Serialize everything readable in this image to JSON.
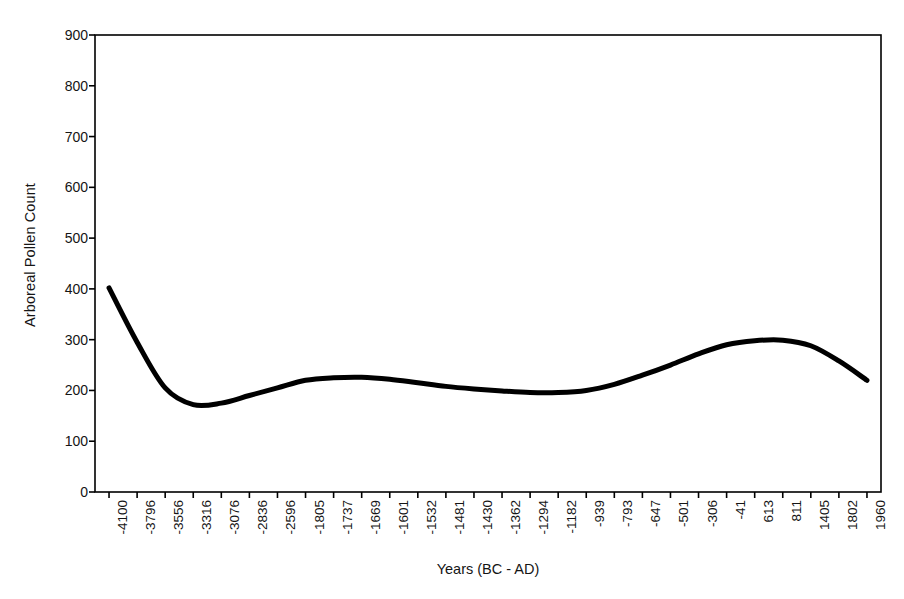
{
  "chart_data": {
    "type": "line",
    "title": "",
    "xlabel": "Years (BC - AD)",
    "ylabel": "Arboreal Pollen Count",
    "ylim": [
      0,
      900
    ],
    "yticks": [
      0,
      100,
      200,
      300,
      400,
      500,
      600,
      700,
      800,
      900
    ],
    "grid": false,
    "legend": "none",
    "categories": [
      "-4100",
      "-3796",
      "-3556",
      "-3316",
      "-3076",
      "-2836",
      "-2596",
      "-1805",
      "-1737",
      "-1669",
      "-1601",
      "-1532",
      "-1481",
      "-1430",
      "-1362",
      "-1294",
      "-1182",
      "-939",
      "-793",
      "-647",
      "-501",
      "-306",
      "-41",
      "613",
      "811",
      "1405",
      "1802",
      "1960"
    ],
    "values": [
      402,
      295,
      205,
      172,
      175,
      190,
      205,
      220,
      225,
      226,
      222,
      215,
      208,
      203,
      199,
      196,
      196,
      200,
      212,
      230,
      250,
      272,
      290,
      298,
      299,
      288,
      258,
      220
    ],
    "series": [
      {
        "name": "Arboreal Pollen Count",
        "color": "#000000",
        "line_width": 5,
        "values": [
          402,
          295,
          205,
          172,
          175,
          190,
          205,
          220,
          225,
          226,
          222,
          215,
          208,
          203,
          199,
          196,
          196,
          200,
          212,
          230,
          250,
          272,
          290,
          298,
          299,
          288,
          258,
          220
        ]
      }
    ],
    "axis_color": "#000000",
    "background": "#ffffff"
  }
}
